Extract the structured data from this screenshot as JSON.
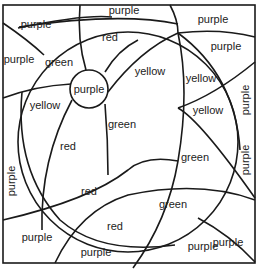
{
  "diagram": {
    "type": "color-by-region puzzle",
    "stroke_color": "#1a1a1a",
    "background": "#ffffff",
    "regions": [
      {
        "id": "top-purple",
        "label": "purple",
        "x": 124,
        "y": 10,
        "rotated": false
      },
      {
        "id": "top-left-purple",
        "label": "purple",
        "x": 36,
        "y": 24,
        "rotated": false
      },
      {
        "id": "top-right-purple",
        "label": "purple",
        "x": 213,
        "y": 19,
        "rotated": false
      },
      {
        "id": "left-purple",
        "label": "purple",
        "x": 19,
        "y": 59,
        "rotated": false
      },
      {
        "id": "green-upper-left",
        "label": "green",
        "x": 59,
        "y": 62,
        "rotated": false
      },
      {
        "id": "red-top",
        "label": "red",
        "x": 110,
        "y": 37,
        "rotated": false
      },
      {
        "id": "right-purple-upper",
        "label": "purple",
        "x": 226,
        "y": 46,
        "rotated": false
      },
      {
        "id": "center-purple",
        "label": "purple",
        "x": 89,
        "y": 89,
        "rotated": false
      },
      {
        "id": "yellow-upper",
        "label": "yellow",
        "x": 150,
        "y": 71,
        "rotated": false
      },
      {
        "id": "yellow-right",
        "label": "yellow",
        "x": 201,
        "y": 78,
        "rotated": false
      },
      {
        "id": "yellow-left",
        "label": "yellow",
        "x": 45,
        "y": 105,
        "rotated": false
      },
      {
        "id": "yellow-lower-right",
        "label": "yellow",
        "x": 208,
        "y": 110,
        "rotated": false
      },
      {
        "id": "right-purple-vertical",
        "label": "purple",
        "x": 245,
        "y": 100,
        "rotated": true
      },
      {
        "id": "green-center",
        "label": "green",
        "x": 122,
        "y": 124,
        "rotated": false
      },
      {
        "id": "red-left-upper",
        "label": "red",
        "x": 68,
        "y": 146,
        "rotated": false
      },
      {
        "id": "green-right",
        "label": "green",
        "x": 195,
        "y": 157,
        "rotated": false
      },
      {
        "id": "right-purple-lower",
        "label": "purple",
        "x": 245,
        "y": 160,
        "rotated": true
      },
      {
        "id": "left-purple-vertical",
        "label": "purple",
        "x": 11,
        "y": 181,
        "rotated": true
      },
      {
        "id": "red-middle",
        "label": "red",
        "x": 89,
        "y": 191,
        "rotated": false
      },
      {
        "id": "green-lower",
        "label": "green",
        "x": 173,
        "y": 204,
        "rotated": false
      },
      {
        "id": "red-lower",
        "label": "red",
        "x": 115,
        "y": 226,
        "rotated": false
      },
      {
        "id": "purple-lower-left",
        "label": "purple",
        "x": 37,
        "y": 237,
        "rotated": false
      },
      {
        "id": "purple-lower-right",
        "label": "purple",
        "x": 228,
        "y": 242,
        "rotated": false
      },
      {
        "id": "purple-bottom",
        "label": "purple",
        "x": 96,
        "y": 252,
        "rotated": false
      },
      {
        "id": "purple-bottom-right",
        "label": "purple",
        "x": 203,
        "y": 246,
        "rotated": false
      }
    ]
  }
}
